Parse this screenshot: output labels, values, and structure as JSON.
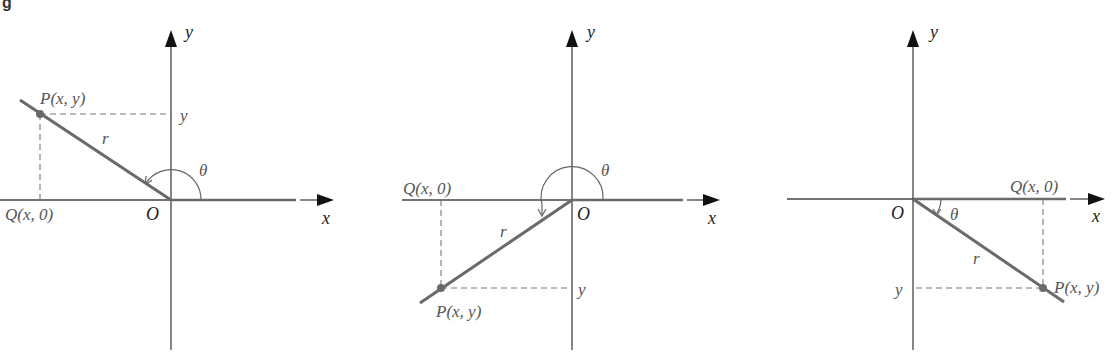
{
  "caption_fragment": "g",
  "panels": [
    {
      "id": "quadrant-2",
      "axes": {
        "x_label": "x",
        "y_label": "y",
        "origin_label": "O"
      },
      "labels": {
        "point": "P(x, y)",
        "projection": "Q(x, 0)",
        "radius": "r",
        "angle": "θ",
        "y_tick": "y"
      }
    },
    {
      "id": "quadrant-3",
      "axes": {
        "x_label": "x",
        "y_label": "y",
        "origin_label": "O"
      },
      "labels": {
        "point": "P(x, y)",
        "projection": "Q(x, 0)",
        "radius": "r",
        "angle": "θ",
        "y_tick": "y"
      }
    },
    {
      "id": "quadrant-4",
      "axes": {
        "x_label": "x",
        "y_label": "y",
        "origin_label": "O"
      },
      "labels": {
        "point": "P(x, y)",
        "projection": "Q(x, 0)",
        "radius": "r",
        "angle": "θ",
        "y_tick": "y"
      }
    }
  ],
  "colors": {
    "axis": "#444444",
    "ray": "#6a6a6a",
    "label": "#555555",
    "arrowhead": "#111111"
  }
}
